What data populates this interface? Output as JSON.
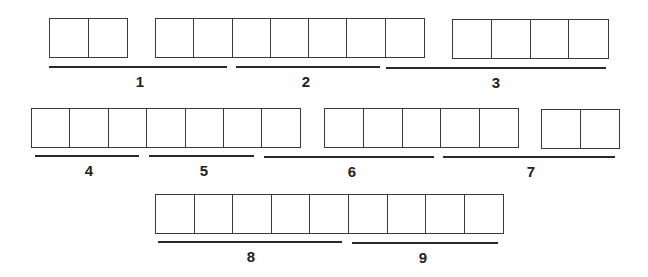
{
  "colors": {
    "cell_border": "#3a3a3a",
    "underline": "#2a2a2a",
    "label": "#222222",
    "background": "#ffffff"
  },
  "rows": [
    {
      "groups": [
        {
          "x": 49,
          "y": 18,
          "cells": 2,
          "cell_w": 38.5
        },
        {
          "x": 155,
          "y": 18,
          "cells": 7,
          "cell_w": 38.3
        },
        {
          "x": 452,
          "y": 19,
          "cells": 4,
          "cell_w": 38.8
        }
      ],
      "segments": [
        {
          "label": "1",
          "x1": 49,
          "x2": 227,
          "y": 66,
          "label_x": 140,
          "label_y": 74
        },
        {
          "label": "2",
          "x1": 236,
          "x2": 380,
          "y": 66,
          "label_x": 306,
          "label_y": 74
        },
        {
          "label": "3",
          "x1": 386,
          "x2": 606,
          "y": 67,
          "label_x": 496,
          "label_y": 75
        }
      ]
    },
    {
      "groups": [
        {
          "x": 31,
          "y": 108,
          "cells": 7,
          "cell_w": 38.4
        },
        {
          "x": 324,
          "y": 108,
          "cells": 5,
          "cell_w": 38.8
        },
        {
          "x": 541,
          "y": 109,
          "cells": 2,
          "cell_w": 38.5
        }
      ],
      "segments": [
        {
          "label": "4",
          "x1": 35,
          "x2": 139,
          "y": 155,
          "label_x": 89,
          "label_y": 163
        },
        {
          "label": "5",
          "x1": 149,
          "x2": 254,
          "y": 155,
          "label_x": 204,
          "label_y": 163
        },
        {
          "label": "6",
          "x1": 264,
          "x2": 434,
          "y": 156,
          "label_x": 352,
          "label_y": 164
        },
        {
          "label": "7",
          "x1": 443,
          "x2": 615,
          "y": 156,
          "label_x": 531,
          "label_y": 164
        }
      ]
    },
    {
      "groups": [
        {
          "x": 155,
          "y": 194,
          "cells": 9,
          "cell_w": 38.6
        }
      ],
      "segments": [
        {
          "label": "8",
          "x1": 158,
          "x2": 342,
          "y": 241,
          "label_x": 251,
          "label_y": 249
        },
        {
          "label": "9",
          "x1": 352,
          "x2": 498,
          "y": 242,
          "label_x": 423,
          "label_y": 250
        }
      ]
    }
  ]
}
